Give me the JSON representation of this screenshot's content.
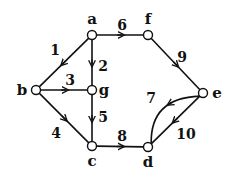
{
  "diagram": {
    "type": "directed-graph",
    "nodes": [
      {
        "id": "a",
        "label": "a",
        "x": 92,
        "y": 35,
        "lx": 92,
        "ly": 24
      },
      {
        "id": "f",
        "label": "f",
        "x": 148,
        "y": 35,
        "lx": 148,
        "ly": 24
      },
      {
        "id": "b",
        "label": "b",
        "x": 36,
        "y": 90,
        "lx": 22,
        "ly": 95
      },
      {
        "id": "g",
        "label": "g",
        "x": 92,
        "y": 90,
        "lx": 104,
        "ly": 95
      },
      {
        "id": "e",
        "label": "e",
        "x": 203,
        "y": 93,
        "lx": 217,
        "ly": 98
      },
      {
        "id": "c",
        "label": "c",
        "x": 92,
        "y": 146,
        "lx": 92,
        "ly": 166
      },
      {
        "id": "d",
        "label": "d",
        "x": 148,
        "y": 147,
        "lx": 148,
        "ly": 167
      }
    ],
    "edges": [
      {
        "from": "a",
        "to": "b",
        "label": "1",
        "lx": 55,
        "ly": 55
      },
      {
        "from": "a",
        "to": "g",
        "label": "2",
        "lx": 103,
        "ly": 71
      },
      {
        "from": "b",
        "to": "g",
        "label": "3",
        "lx": 70,
        "ly": 85
      },
      {
        "from": "b",
        "to": "c",
        "label": "4",
        "lx": 56,
        "ly": 138
      },
      {
        "from": "g",
        "to": "c",
        "label": "5",
        "lx": 103,
        "ly": 122
      },
      {
        "from": "a",
        "to": "f",
        "label": "6",
        "lx": 122,
        "ly": 30
      },
      {
        "from": "e",
        "to": "d",
        "label": "7",
        "lx": 151,
        "ly": 103,
        "curved": true
      },
      {
        "from": "c",
        "to": "d",
        "label": "8",
        "lx": 122,
        "ly": 141
      },
      {
        "from": "f",
        "to": "e",
        "label": "9",
        "lx": 182,
        "ly": 62
      },
      {
        "from": "e",
        "to": "d",
        "label": "10",
        "lx": 186,
        "ly": 139
      }
    ]
  }
}
